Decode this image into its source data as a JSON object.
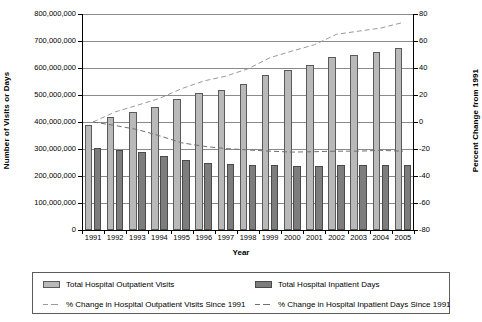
{
  "chart_data": {
    "type": "bar",
    "title": "",
    "xlabel": "Year",
    "ylabel": "Number of Visits or Days",
    "ylabel_right": "Percent Change from 1991",
    "grid": true,
    "legend_position": "bottom",
    "categories": [
      "1991",
      "1992",
      "1993",
      "1994",
      "1995",
      "1996",
      "1997",
      "1998",
      "1999",
      "2000",
      "2001",
      "2002",
      "2003",
      "2004",
      "2005"
    ],
    "ylim": [
      0,
      800000000
    ],
    "yticks": [
      "0",
      "100,000,000",
      "200,000,000",
      "300,000,000",
      "400,000,000",
      "500,000,000",
      "600,000,000",
      "700,000,000",
      "800,000,000"
    ],
    "ytick_values": [
      0,
      100000000,
      200000000,
      300000000,
      400000000,
      500000000,
      600000000,
      700000000,
      800000000
    ],
    "ylim_right": [
      -80,
      80
    ],
    "yticks_right": [
      "-80",
      "-60",
      "-40",
      "-20",
      "0",
      "20",
      "40",
      "60",
      "80"
    ],
    "ytick_values_right": [
      -80,
      -60,
      -40,
      -20,
      0,
      20,
      40,
      60,
      80
    ],
    "series": [
      {
        "name": "Total Hospital Outpatient Visits",
        "type": "bar",
        "axis": "left",
        "color": "#b9b9b9",
        "values": [
          388000000,
          417000000,
          436000000,
          456000000,
          484000000,
          506000000,
          520000000,
          541000000,
          573000000,
          592000000,
          610000000,
          640000000,
          649000000,
          658000000,
          674000000
        ]
      },
      {
        "name": "Total Hospital Inpatient Days",
        "type": "bar",
        "axis": "left",
        "color": "#7d7d7d",
        "values": [
          305000000,
          297000000,
          288000000,
          274000000,
          258000000,
          250000000,
          245000000,
          242000000,
          239000000,
          237000000,
          238000000,
          239000000,
          239000000,
          241000000,
          239000000
        ]
      },
      {
        "name": "% Change in Hospital Outpatient Visits Since 1991",
        "type": "line",
        "style": "dashed",
        "axis": "right",
        "color": "#9a9a9a",
        "values": [
          0,
          7.5,
          12.4,
          17.5,
          24.7,
          30.4,
          34.0,
          39.4,
          47.7,
          52.6,
          57.2,
          65.0,
          67.3,
          69.6,
          73.7
        ]
      },
      {
        "name": "% Change in Hospital Inpatient Days Since 1991",
        "type": "line",
        "style": "dashed",
        "axis": "right",
        "color": "#6f6f6f",
        "values": [
          0,
          -2.6,
          -5.6,
          -10.2,
          -15.4,
          -18.0,
          -19.7,
          -20.7,
          -21.6,
          -22.3,
          -22.0,
          -21.6,
          -21.6,
          -21.0,
          -21.6
        ]
      }
    ],
    "legend": [
      "Total Hospital Outpatient Visits",
      "Total Hospital Inpatient Days",
      "% Change in Hospital Outpatient Visits Since 1991",
      "% Change in Hospital Inpatient Days Since 1991"
    ]
  }
}
